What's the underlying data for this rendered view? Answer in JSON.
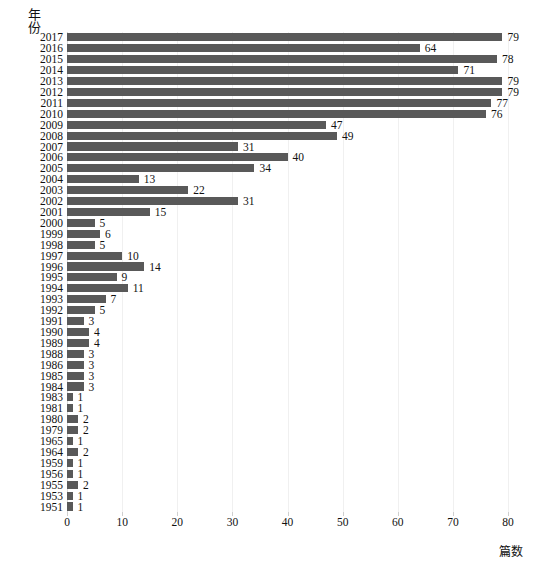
{
  "chart_data": {
    "type": "bar",
    "orientation": "horizontal",
    "title": "",
    "xlabel": "篇数",
    "ylabel": "年份",
    "xlim": [
      0,
      80
    ],
    "xticks": [
      0,
      10,
      20,
      30,
      40,
      50,
      60,
      70,
      80
    ],
    "grid": true,
    "legend": null,
    "bar_color": "#595959",
    "categories": [
      "2017",
      "2016",
      "2015",
      "2014",
      "2013",
      "2012",
      "2011",
      "2010",
      "2009",
      "2008",
      "2007",
      "2006",
      "2005",
      "2004",
      "2003",
      "2002",
      "2001",
      "2000",
      "1999",
      "1998",
      "1997",
      "1996",
      "1995",
      "1994",
      "1993",
      "1992",
      "1991",
      "1990",
      "1989",
      "1988",
      "1986",
      "1985",
      "1984",
      "1983",
      "1981",
      "1980",
      "1979",
      "1965",
      "1964",
      "1959",
      "1956",
      "1955",
      "1953",
      "1951"
    ],
    "values": [
      79,
      64,
      78,
      71,
      79,
      79,
      77,
      76,
      47,
      49,
      31,
      40,
      34,
      13,
      22,
      31,
      15,
      5,
      6,
      5,
      10,
      14,
      9,
      11,
      7,
      5,
      3,
      4,
      4,
      3,
      3,
      3,
      3,
      1,
      1,
      2,
      2,
      1,
      2,
      1,
      1,
      2,
      1,
      1
    ]
  }
}
